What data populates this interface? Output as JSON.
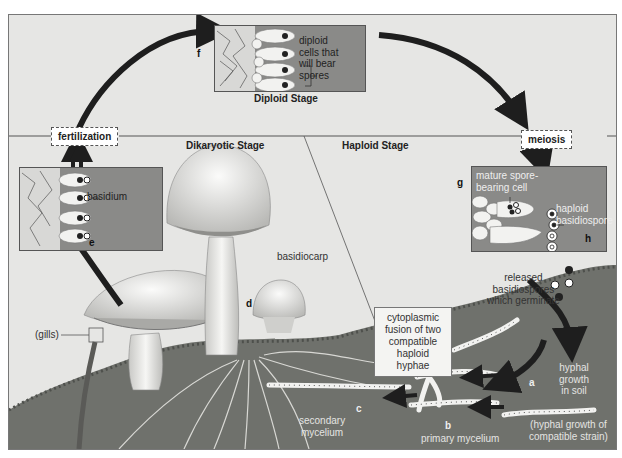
{
  "diagram": {
    "stages": {
      "diploid": "Diploid Stage",
      "dikaryotic": "Dikaryotic Stage",
      "haploid": "Haploid Stage"
    },
    "events": {
      "fertilization": "fertilization",
      "meiosis": "meiosis"
    },
    "letters": {
      "a": "a",
      "b": "b",
      "c": "c",
      "d": "d",
      "e": "e",
      "f": "f",
      "g": "g",
      "h": "h"
    },
    "labels": {
      "diploid_cells": [
        "diploid",
        "cells that",
        "will bear",
        "spores"
      ],
      "basidium": "basidium",
      "mature_cell": [
        "mature spore-",
        "bearing cell"
      ],
      "haploid_basidiospore": [
        "haploid",
        "basidiospore"
      ],
      "released": [
        "released",
        "basidiospores",
        "which germinate"
      ],
      "cytoplasmic_fusion": [
        "cytoplasmic",
        "fusion of two",
        "compatible",
        "haploid hyphae"
      ],
      "hyphal_growth": [
        "hyphal",
        "growth",
        "in soil"
      ],
      "compatible_strain": [
        "(hyphal growth of",
        "compatible strain)"
      ],
      "primary_mycelium": "primary mycelium",
      "secondary_mycelium": [
        "secondary",
        "mycelium"
      ],
      "basidiocarp": "basidiocarp",
      "gills": "(gills)"
    },
    "colors": {
      "background": "#e6e6e4",
      "inset": "#8a8a88",
      "arrow": "#1e1e1e",
      "soil": "#6f716c"
    }
  }
}
